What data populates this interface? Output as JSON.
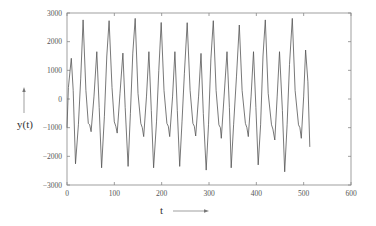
{
  "chart_data": {
    "type": "line",
    "title": "",
    "xlabel": "t",
    "ylabel": "y(t)",
    "xlim": [
      0,
      600
    ],
    "ylim": [
      -3000,
      3000
    ],
    "x_ticks": [
      0,
      100,
      200,
      300,
      400,
      500,
      600
    ],
    "y_ticks": [
      -3000,
      -2000,
      -1000,
      0,
      1000,
      2000,
      3000
    ],
    "x_tick_labels": [
      "0",
      "100",
      "200",
      "300",
      "400",
      "500",
      "600"
    ],
    "y_tick_labels": [
      "-3000",
      "-2000",
      "-1000",
      "0",
      "1000",
      "2000",
      "3000"
    ],
    "grid": false,
    "legend": null,
    "series": [
      {
        "name": "y(t)",
        "color": "#555555",
        "x": [
          0,
          3,
          9,
          13,
          18,
          24,
          29,
          34,
          40,
          45,
          48,
          51,
          57,
          63,
          68,
          73,
          79,
          84,
          89,
          95,
          100,
          103,
          106,
          112,
          118,
          123,
          129,
          134,
          139,
          144,
          150,
          156,
          159,
          162,
          168,
          173,
          178,
          183,
          189,
          194,
          199,
          205,
          211,
          214,
          217,
          223,
          228,
          233,
          238,
          243,
          248,
          254,
          260,
          266,
          269,
          272,
          278,
          283,
          288,
          294,
          299,
          304,
          309,
          315,
          321,
          324,
          326,
          332,
          338,
          343,
          347,
          352,
          358,
          364,
          370,
          377,
          380,
          383,
          389,
          394,
          399,
          404,
          409,
          414,
          419,
          425,
          432,
          435,
          439,
          444,
          449,
          455,
          460,
          465,
          470,
          476,
          482,
          489,
          492,
          495,
          500,
          504,
          509,
          513
        ],
        "y": [
          -1000,
          400,
          1420,
          300,
          -2260,
          -900,
          700,
          2760,
          300,
          -850,
          -900,
          -1140,
          100,
          1650,
          -300,
          -2400,
          -600,
          1500,
          2730,
          400,
          -800,
          -950,
          -1190,
          200,
          1600,
          -300,
          -2350,
          -500,
          1600,
          2810,
          200,
          -850,
          -1000,
          -1310,
          100,
          1650,
          -400,
          -2400,
          -800,
          1000,
          2670,
          300,
          -850,
          -950,
          -1310,
          100,
          1650,
          -400,
          -2350,
          -800,
          900,
          2660,
          300,
          -850,
          -950,
          -1290,
          100,
          1590,
          -500,
          -2480,
          -900,
          1400,
          2730,
          300,
          -900,
          -1000,
          -1370,
          100,
          1650,
          -300,
          -2400,
          -900,
          800,
          2580,
          300,
          -850,
          -1000,
          -1310,
          100,
          1650,
          -300,
          -2300,
          -900,
          1500,
          2760,
          200,
          -900,
          -1050,
          -1430,
          100,
          1650,
          -400,
          -2540,
          -900,
          1200,
          2810,
          300,
          -900,
          -1000,
          -1370,
          100,
          1710,
          600,
          -1670
        ]
      }
    ]
  },
  "axes": {
    "xlabel": "t",
    "ylabel": "y(t)"
  }
}
